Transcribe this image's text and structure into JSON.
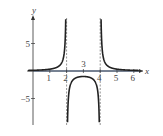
{
  "chart_data": {
    "type": "line",
    "title": "",
    "xlabel": "x",
    "ylabel": "y",
    "xlim": [
      -0.2,
      6.8
    ],
    "ylim": [
      -10,
      10
    ],
    "x_ticks": [
      1,
      2,
      3,
      4,
      5,
      6
    ],
    "x_tick_labels": [
      "1",
      "2",
      "3",
      "4",
      "5",
      "6"
    ],
    "y_ticks": [
      5,
      -5
    ],
    "y_tick_labels": [
      "5",
      "−5"
    ],
    "vertical_asymptotes": [
      2,
      4
    ],
    "horizontal_asymptote": 0,
    "function": "1/((x-2)(x-4))",
    "key_points": [
      {
        "x": 3,
        "y": -1
      },
      {
        "x": 1,
        "y": 0.33
      },
      {
        "x": 5,
        "y": 0.33
      }
    ],
    "grid": false,
    "legend": null
  },
  "colors": {
    "curve": "#222222",
    "axis": "#333333",
    "asymptote": "#777777",
    "horizontal_asymptote": "#4a6fa5"
  }
}
